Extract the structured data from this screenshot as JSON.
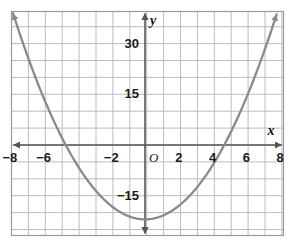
{
  "chart_data": {
    "type": "line",
    "title": "",
    "subtitle": "",
    "xlabel": "x",
    "ylabel": "y",
    "origin_label": "O",
    "equation": "y = x^2 - 22",
    "vertex": [
      0,
      -22
    ],
    "roots": [
      -4.7,
      4.7
    ],
    "xlim": [
      -8.8,
      8.8
    ],
    "ylim": [
      -30,
      36
    ],
    "grid": true,
    "grid_step_x": 1,
    "grid_step_y": 5,
    "legend": "none",
    "x_ticks": [
      {
        "value": -8,
        "label": "−8"
      },
      {
        "value": -6,
        "label": "−6"
      },
      {
        "value": -2,
        "label": "−2"
      },
      {
        "value": 2,
        "label": "2"
      },
      {
        "value": 4,
        "label": "4"
      },
      {
        "value": 6,
        "label": "6"
      },
      {
        "value": 8,
        "label": "8"
      }
    ],
    "y_ticks": [
      {
        "value": 30,
        "label": "30"
      },
      {
        "value": 15,
        "label": "15"
      },
      {
        "value": -15,
        "label": "−15"
      }
    ],
    "series": [
      {
        "name": "parabola",
        "color": "#8a8a8a",
        "arrow_start": true,
        "arrow_end": true,
        "x": [
          -8.2,
          -7.8,
          -7.4,
          -7.0,
          -6.6,
          -6.2,
          -5.8,
          -5.4,
          -5.0,
          -4.6,
          -4.2,
          -3.8,
          -3.4,
          -3.0,
          -2.6,
          -2.2,
          -1.8,
          -1.4,
          -1.0,
          -0.6,
          -0.2,
          0.2,
          0.6,
          1.0,
          1.4,
          1.8,
          2.2,
          2.6,
          3.0,
          3.4,
          3.8,
          4.2,
          4.6,
          5.0,
          5.4,
          5.8,
          6.2,
          6.6,
          7.0,
          7.4,
          7.8,
          8.2
        ],
        "y": [
          45.24,
          38.84,
          32.76,
          27.0,
          21.56,
          16.44,
          11.64,
          7.16,
          3.0,
          -0.84,
          -4.36,
          -7.56,
          -10.44,
          -13.0,
          -15.24,
          -17.16,
          -18.76,
          -20.04,
          -21.0,
          -21.64,
          -21.96,
          -21.96,
          -21.64,
          -21.0,
          -20.04,
          -18.76,
          -17.16,
          -15.24,
          -13.0,
          -10.44,
          -7.56,
          -4.36,
          -0.84,
          3.0,
          7.16,
          11.64,
          16.44,
          21.56,
          27.0,
          32.76,
          38.84,
          45.24
        ]
      }
    ],
    "colors": {
      "curve": "#8a8a8a",
      "axis": "#555555",
      "grid": "#bcbcbc",
      "border": "#9a9a9a",
      "text": "#1a1a1a",
      "background": "#ffffff"
    }
  }
}
